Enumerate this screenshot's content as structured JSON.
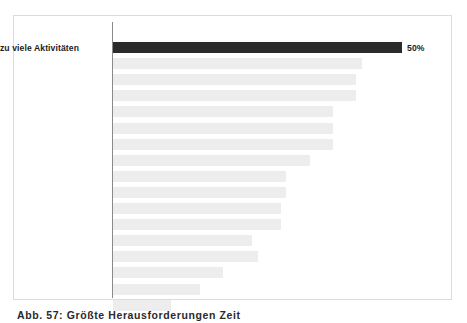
{
  "figure": {
    "caption": "Abb. 57:  Größte Herausforderungen  Zeit"
  },
  "chart_data": {
    "type": "bar",
    "orientation": "horizontal",
    "title": "",
    "xlabel": "",
    "ylabel": "",
    "grid": false,
    "legend": null,
    "xlim": [
      0,
      50
    ],
    "axis_line": "vertical category axis at zero",
    "colors": {
      "highlight_bar": "#2b2b2b",
      "other_bars": "#ededed",
      "axis_line": "#8a8a8a",
      "frame": "#dcdcdc",
      "label_text": "#1d1d1d",
      "background": "#ffffff"
    },
    "note": "Only the top category is labelled and highlighted; remaining 16 bars are rendered blank/anonymised in the source image.",
    "categories": [
      "zu viele Aktivitäten",
      "",
      "",
      "",
      "",
      "",
      "",
      "",
      "",
      "",
      "",
      "",
      "",
      "",
      "",
      "",
      ""
    ],
    "values": [
      50,
      43,
      42,
      42,
      38,
      38,
      38,
      34,
      30,
      30,
      29,
      29,
      24,
      25,
      19,
      15,
      10
    ],
    "value_labels": [
      "50%",
      "",
      "",
      "",
      "",
      "",
      "",
      "",
      "",
      "",
      "",
      "",
      "",
      "",
      "",
      "",
      ""
    ]
  }
}
